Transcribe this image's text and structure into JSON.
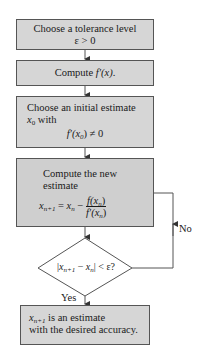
{
  "diagram": {
    "type": "flowchart",
    "colors": {
      "box_fill": "#d6d6d6",
      "border": "#555555",
      "line": "#555555",
      "text": "#1a1a1a"
    },
    "steps": [
      {
        "id": "tolerance",
        "line1": "Choose a tolerance level",
        "line2": "ε > 0"
      },
      {
        "id": "derivative",
        "prefix": "Compute ",
        "expr": "f′(x)",
        "suffix": "."
      },
      {
        "id": "initial",
        "line1": "Choose an initial estimate",
        "var": "x",
        "var_sub": "0",
        "line2_rest": " with",
        "cond": "f′(x",
        "cond_sub": "0",
        "cond_rest": ") ≠ 0"
      },
      {
        "id": "iterate",
        "line1": "Compute the new",
        "line2": "estimate",
        "lhs": "x",
        "lhs_sub": "n+1",
        "eq": " = ",
        "mid": "x",
        "mid_sub": "n",
        "minus": " − ",
        "num": "f(x",
        "num_sub": "n",
        "num_end": ")",
        "den": "f′(x",
        "den_sub": "n",
        "den_end": ")"
      },
      {
        "id": "decision",
        "abs_open": "|",
        "a": "x",
        "a_sub": "n+1",
        "minus": " − ",
        "b": "x",
        "b_sub": "n",
        "abs_close": "|",
        "rest": " < ε?"
      },
      {
        "id": "result",
        "var": "x",
        "var_sub": "n+1",
        "line1_rest": " is an estimate",
        "line2": "with the desired accuracy."
      }
    ],
    "edges": {
      "yes_label": "Yes",
      "no_label": "No"
    }
  }
}
